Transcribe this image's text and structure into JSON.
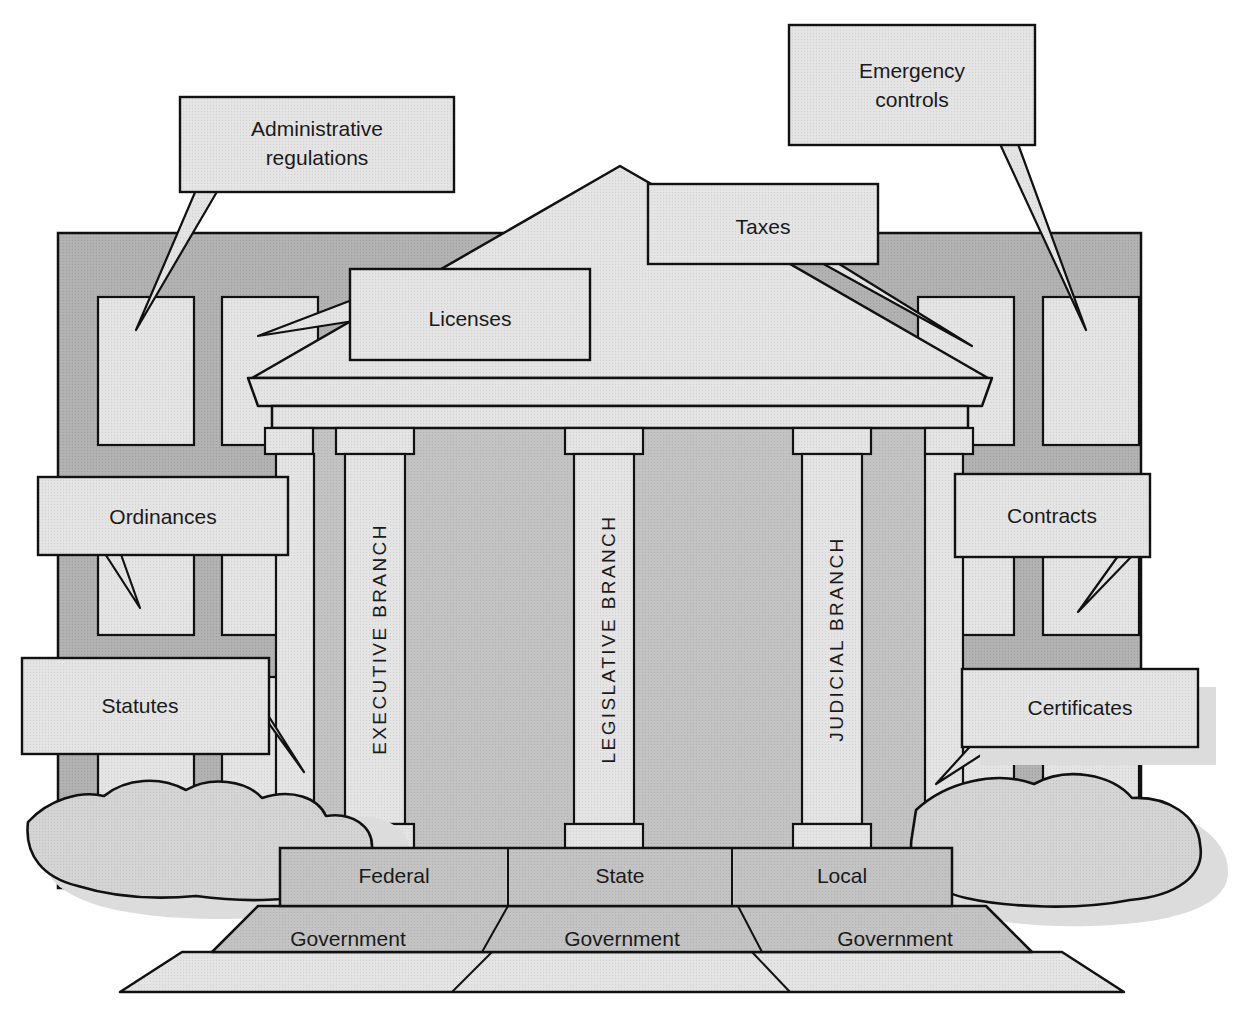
{
  "diagram": {
    "building": {
      "columns": [
        {
          "id": "executive",
          "label": "EXECUTIVE BRANCH"
        },
        {
          "id": "legislative",
          "label": "LEGISLATIVE BRANCH"
        },
        {
          "id": "judicial",
          "label": "JUDICIAL BRANCH"
        }
      ],
      "steps_upper": [
        {
          "id": "federal",
          "label": "Federal"
        },
        {
          "id": "state",
          "label": "State"
        },
        {
          "id": "local",
          "label": "Local"
        }
      ],
      "steps_lower": [
        {
          "id": "federal-government",
          "label": "Government"
        },
        {
          "id": "state-government",
          "label": "Government"
        },
        {
          "id": "local-government",
          "label": "Government"
        }
      ]
    },
    "callouts": [
      {
        "id": "administrative-regulations",
        "line1": "Administrative",
        "line2": "regulations"
      },
      {
        "id": "emergency-controls",
        "line1": "Emergency",
        "line2": "controls"
      },
      {
        "id": "taxes",
        "line1": "Taxes",
        "line2": ""
      },
      {
        "id": "licenses",
        "line1": "Licenses",
        "line2": ""
      },
      {
        "id": "ordinances",
        "line1": "Ordinances",
        "line2": ""
      },
      {
        "id": "contracts",
        "line1": "Contracts",
        "line2": ""
      },
      {
        "id": "statutes",
        "line1": "Statutes",
        "line2": ""
      },
      {
        "id": "certificates",
        "line1": "Certificates",
        "line2": ""
      }
    ],
    "colors": {
      "outline": "#111111",
      "paper": "#ffffff",
      "wall_dark": "#b0b0b0",
      "stone_mid": "#c0c0c0",
      "stone_light": "#e2e2e2",
      "callout_fill": "#e6e6e6",
      "shadow": "#d8d8d8",
      "bush_fill": "#d2d2d2"
    }
  }
}
